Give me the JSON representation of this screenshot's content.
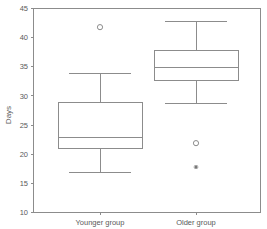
{
  "chart_data": {
    "type": "box",
    "title": "",
    "subtitle": "",
    "xlabel": "",
    "ylabel": "Days",
    "ylim": [
      10,
      45
    ],
    "ytick_values": [
      10,
      15,
      20,
      25,
      30,
      35,
      40,
      45
    ],
    "ytick_labels": [
      "10",
      "15",
      "20",
      "25",
      "30",
      "35",
      "40",
      "45"
    ],
    "grid": false,
    "legend": false,
    "categories": [
      "Younger group",
      "Older group"
    ],
    "boxes": [
      {
        "category": "Younger group",
        "whisker_low": 16.9,
        "q1": 21.0,
        "median": 22.9,
        "q3": 28.9,
        "whisker_high": 33.9,
        "outliers": [
          41.8
        ],
        "extremes": []
      },
      {
        "category": "Older group",
        "whisker_low": 28.7,
        "q1": 32.7,
        "median": 34.9,
        "q3": 37.8,
        "whisker_high": 42.7,
        "outliers": [
          21.9
        ],
        "extremes": [
          17.8
        ]
      }
    ]
  },
  "axis": {
    "y_title": "Days",
    "y_min_label": "10",
    "y_max_label": "45"
  },
  "colors": {
    "line": "#8c8c8c",
    "text": "#5a5a5a",
    "background": "#ffffff"
  }
}
